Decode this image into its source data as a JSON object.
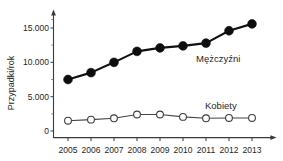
{
  "chart_data": {
    "type": "line",
    "title": "",
    "xlabel": "",
    "ylabel": "Przypadki/rok",
    "categories": [
      "2005",
      "2006",
      "2007",
      "2008",
      "2009",
      "2010",
      "2011",
      "2012",
      "2013"
    ],
    "ylim": [
      0,
      16500
    ],
    "ytick_values": [
      0,
      5000,
      10000,
      15000
    ],
    "ytick_labels": [
      "0",
      "5.000",
      "10.000",
      "15.000"
    ],
    "minor_ticks": true,
    "grid": false,
    "legend_position": "inline-right",
    "series": [
      {
        "name": "Mężczyźni",
        "marker": "filled-circle",
        "values": [
          7500,
          8500,
          10000,
          11600,
          12100,
          12400,
          12800,
          14600,
          15600
        ]
      },
      {
        "name": "Kobiety",
        "marker": "open-circle",
        "values": [
          1500,
          1650,
          1850,
          2400,
          2400,
          2050,
          1850,
          1900,
          1900
        ]
      }
    ],
    "annotations": [
      {
        "text": "Mężczyźni",
        "x": 2011.3,
        "y": 10900
      },
      {
        "text": "Kobiety",
        "x": 2011.2,
        "y": 4100
      }
    ],
    "colors": {
      "men": "#0d0d0d",
      "women_fill": "#ffffff",
      "women_stroke": "#3d3d3d",
      "axis": "#3a3a3a",
      "text": "#262626",
      "background": "#ffffff"
    }
  }
}
